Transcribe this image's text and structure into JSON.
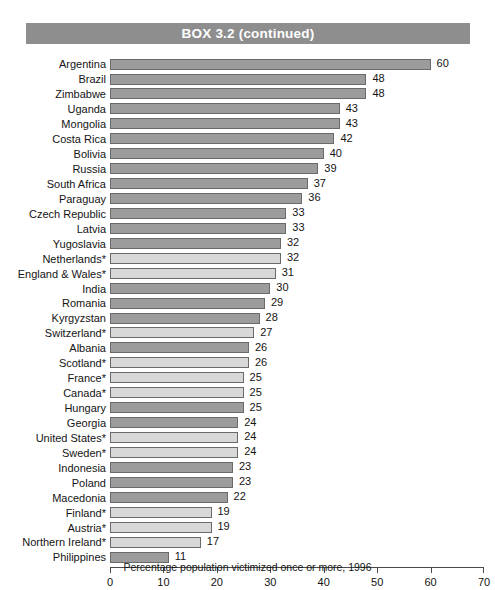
{
  "box": {
    "title": "BOX 3.2 (continued)",
    "band_color": "#8e8e8e"
  },
  "caption": "Percentage population victimized once or more, 1996",
  "colors": {
    "bar_dark": "#9c9c9c",
    "bar_light": "#d8d8d8",
    "bar_border": "#6a6a6a",
    "axis": "#4a4a4a",
    "text": "#141414",
    "title_text": "#ffffff"
  },
  "chart_data": {
    "type": "bar",
    "orientation": "horizontal",
    "title": "BOX 3.2 (continued)",
    "xlabel": "Percentage population victimized once or more, 1996",
    "ylabel": "",
    "xlim": [
      0,
      70
    ],
    "xticks": [
      0,
      10,
      20,
      30,
      40,
      50,
      60,
      70
    ],
    "grid": false,
    "legend": null,
    "categories": [
      "Argentina",
      "Brazil",
      "Zimbabwe",
      "Uganda",
      "Mongolia",
      "Costa Rica",
      "Bolivia",
      "Russia",
      "South Africa",
      "Paraguay",
      "Czech Republic",
      "Latvia",
      "Yugoslavia",
      "Netherlands*",
      "England & Wales*",
      "India",
      "Romania",
      "Kyrgyzstan",
      "Switzerland*",
      "Albania",
      "Scotland*",
      "France*",
      "Canada*",
      "Hungary",
      "Georgia",
      "United States*",
      "Sweden*",
      "Indonesia",
      "Poland",
      "Macedonia",
      "Finland*",
      "Austria*",
      "Northern Ireland*",
      "Philippines"
    ],
    "values": [
      60,
      48,
      48,
      43,
      43,
      42,
      40,
      39,
      37,
      36,
      33,
      33,
      32,
      32,
      31,
      30,
      29,
      28,
      27,
      26,
      26,
      25,
      25,
      25,
      24,
      24,
      24,
      23,
      23,
      22,
      19,
      19,
      17,
      11
    ],
    "shades": [
      "dark",
      "dark",
      "dark",
      "dark",
      "dark",
      "dark",
      "dark",
      "dark",
      "dark",
      "dark",
      "dark",
      "dark",
      "dark",
      "light",
      "light",
      "dark",
      "dark",
      "dark",
      "light",
      "dark",
      "light",
      "light",
      "light",
      "dark",
      "dark",
      "light",
      "light",
      "dark",
      "dark",
      "dark",
      "light",
      "light",
      "light",
      "dark"
    ]
  }
}
